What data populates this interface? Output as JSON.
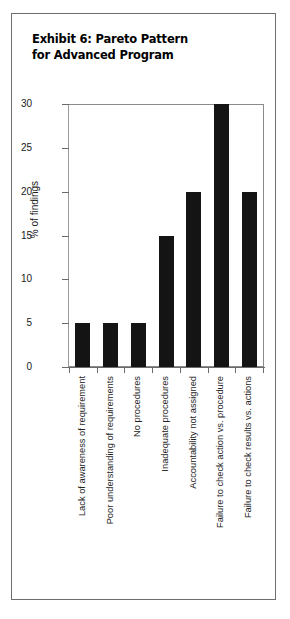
{
  "figure": {
    "title": "Exhibit 6: Pareto Pattern\nfor Advanced Program",
    "border_color": "#6e6e6e",
    "background": "#ffffff"
  },
  "chart_data": {
    "type": "bar",
    "title": "Exhibit 6: Pareto Pattern for Advanced Program",
    "xlabel": "",
    "ylabel": "% of findings",
    "ylim": [
      0,
      30
    ],
    "yticks": [
      0,
      5,
      10,
      15,
      20,
      25,
      30
    ],
    "ytick_labels": [
      "0",
      "5",
      "10",
      "15",
      "20",
      "25",
      "30"
    ],
    "grid": false,
    "legend": null,
    "bar_color": "#141414",
    "categories": [
      "Lack of awareness of requirement",
      "Poor understanding of requirements",
      "No procedures",
      "Inadequate procedures",
      "Accountability not assigned",
      "Failure to check action vs. procedure",
      "Failure to check results vs. actions"
    ],
    "values": [
      5,
      5,
      5,
      15,
      20,
      30,
      20
    ]
  }
}
